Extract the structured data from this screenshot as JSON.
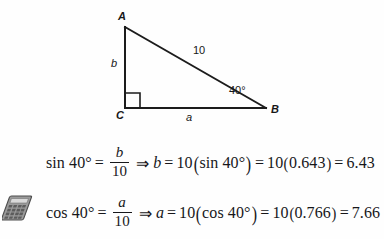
{
  "figure": {
    "name": "right-triangle-abc",
    "vertices": [
      {
        "key": "A",
        "label": "A",
        "x": 125,
        "y": 27
      },
      {
        "key": "B",
        "label": "B",
        "x": 266,
        "y": 108
      },
      {
        "key": "C",
        "label": "C",
        "x": 125,
        "y": 108
      }
    ],
    "side_labels": {
      "opposite": "b",
      "adjacent": "a",
      "hypotenuse": "10"
    },
    "angle_label": "40°",
    "right_angle_at": "C",
    "stroke_color": "#1c1c1c"
  },
  "equations": [
    {
      "id": "sin",
      "function": "sin",
      "angle": "40°",
      "lhs": "sin 40°",
      "equals": "=",
      "fraction": {
        "numerator": "b",
        "denominator": "10"
      },
      "implies": "⇒",
      "solve_for": "b",
      "expression": "10(sin 40°)",
      "substituted": "10(0.643)",
      "ratio_value": "0.643",
      "result": "6.43",
      "multiplier": "10",
      "paren_open": "(",
      "paren_close": ")"
    },
    {
      "id": "cos",
      "function": "cos",
      "angle": "40°",
      "lhs": "cos 40°",
      "equals": "=",
      "fraction": {
        "numerator": "a",
        "denominator": "10"
      },
      "implies": "⇒",
      "solve_for": "a",
      "expression": "10(cos 40°)",
      "substituted": "10(0.766)",
      "ratio_value": "0.766",
      "result": "7.66",
      "multiplier": "10",
      "paren_open": "(",
      "paren_close": ")"
    }
  ],
  "margin_icon": {
    "name": "calculator-icon",
    "color": "#8a8a8a"
  }
}
